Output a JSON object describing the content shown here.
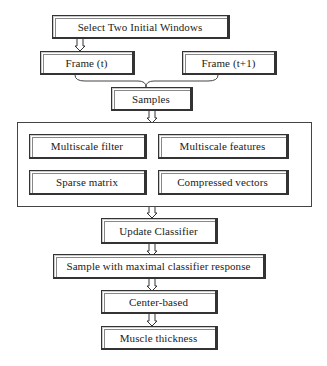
{
  "diagram": {
    "type": "flowchart",
    "nodes": {
      "select_windows": "Select Two Initial Windows",
      "frame_t": "Frame (t)",
      "frame_t1": "Frame (t+1)",
      "samples": "Samples",
      "multiscale_filter": "Multiscale filter",
      "multiscale_features": "Multiscale features",
      "sparse_matrix": "Sparse matrix",
      "compressed_vectors": "Compressed vectors",
      "update_classifier": "Update Classifier",
      "max_response": "Sample with maximal classifier response",
      "center_based": "Center-based",
      "muscle_thickness": "Muscle thickness"
    },
    "edges": [
      [
        "Select Two Initial Windows",
        "Frame (t)"
      ],
      [
        "Frame (t)",
        "Samples"
      ],
      [
        "Frame (t+1)",
        "Samples"
      ],
      [
        "Samples",
        "Feature group"
      ],
      [
        "Feature group",
        "Update Classifier"
      ],
      [
        "Update Classifier",
        "Sample with maximal classifier response"
      ],
      [
        "Sample with maximal classifier response",
        "Center-based"
      ],
      [
        "Center-based",
        "Muscle thickness"
      ]
    ],
    "group": {
      "label": "Feature group",
      "members": [
        "Multiscale filter",
        "Multiscale features",
        "Sparse matrix",
        "Compressed vectors"
      ]
    }
  }
}
